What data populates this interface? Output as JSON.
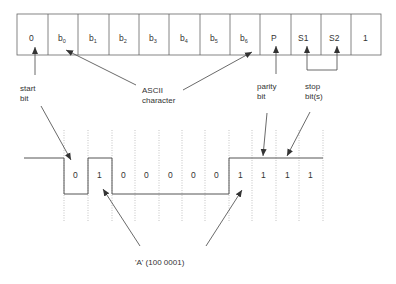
{
  "frame": {
    "cells": [
      {
        "main": "0",
        "sub": ""
      },
      {
        "main": "b",
        "sub": "0"
      },
      {
        "main": "b",
        "sub": "1"
      },
      {
        "main": "b",
        "sub": "2"
      },
      {
        "main": "b",
        "sub": "3"
      },
      {
        "main": "b",
        "sub": "4"
      },
      {
        "main": "b",
        "sub": "5"
      },
      {
        "main": "b",
        "sub": "6"
      },
      {
        "main": "P",
        "sub": ""
      },
      {
        "main": "S1",
        "sub": ""
      },
      {
        "main": "S2",
        "sub": ""
      },
      {
        "main": "1",
        "sub": ""
      }
    ]
  },
  "labels": {
    "start_bit_1": "start",
    "start_bit_2": "bit",
    "ascii_1": "ASCII",
    "ascii_2": "character",
    "parity_1": "parity",
    "parity_2": "bit",
    "stop_1": "stop",
    "stop_2": "bit(s)",
    "char_a": "'A' (100 0001)"
  },
  "waveform": {
    "bits": [
      "0",
      "1",
      "0",
      "0",
      "0",
      "0",
      "0",
      "1",
      "1",
      "1",
      "1"
    ]
  },
  "colors": {
    "line": "#555555",
    "text": "#333333",
    "grid": "#aaaaaa"
  }
}
